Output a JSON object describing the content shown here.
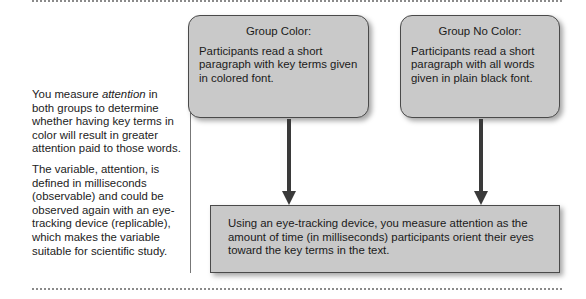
{
  "side_note": {
    "paragraph1": {
      "before": "You measure ",
      "emphasis": "attention",
      "after": " in both groups to determine whether having key terms in color will result in greater attention paid to those words."
    },
    "paragraph2": "The variable, attention, is defined in milliseconds (observable) and could be observed again with an eye-tracking device (replicable), which makes the variable suitable for scientific study."
  },
  "groups": [
    {
      "title": "Group Color:",
      "description": "Participants read a short paragraph with key terms given in colored font."
    },
    {
      "title": "Group No Color:",
      "description": "Participants read a short paragraph with all words given in plain black font."
    }
  ],
  "measurement_box": {
    "text": "Using an eye-tracking device, you measure attention as the amount of time (in milliseconds) participants orient their eyes toward the key terms in the text."
  },
  "colors": {
    "box_fill": "#c9c9c9",
    "box_border": "#4a4a4a",
    "arrow": "#3a3a3a",
    "rule": "#8a8a8a"
  }
}
